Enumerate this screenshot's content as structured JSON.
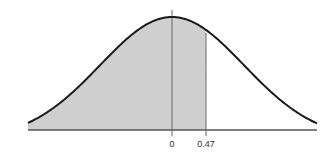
{
  "chart_data": {
    "type": "area",
    "title": "",
    "xlabel": "",
    "ylabel": "",
    "x_range": [
      -2,
      2
    ],
    "tick_labels": [
      "0",
      "0.47"
    ],
    "tick_values": [
      0,
      0.47
    ],
    "shaded_region": {
      "from": "-inf",
      "to": 0.47
    },
    "grid": false,
    "legend": null
  },
  "colors": {
    "curve": "#1a1a1a",
    "shade": "#cfcfcf",
    "axis": "#555555",
    "markers": "#666666"
  },
  "labels": {
    "zero": "0",
    "z_value": "0.47"
  }
}
